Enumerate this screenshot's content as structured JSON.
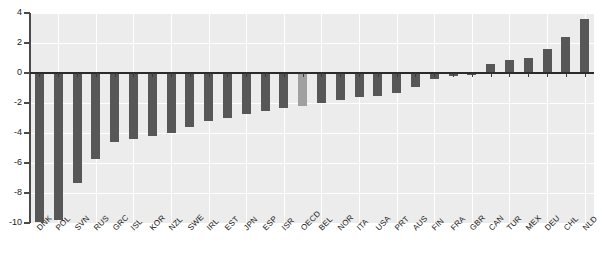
{
  "chart_data": {
    "type": "bar",
    "title": "",
    "subtitle": "",
    "xlabel": "",
    "ylabel": "",
    "ylim": [
      -10,
      4
    ],
    "yticks": [
      4,
      2,
      0,
      -2,
      -4,
      -6,
      -8,
      -10
    ],
    "ytick_labels": [
      "4",
      "2",
      "0",
      "-2",
      "-4",
      "-6",
      "-8",
      "-10"
    ],
    "grid": true,
    "legend": "none",
    "highlight_category": "OECD",
    "bar_color": "#575757",
    "highlight_color": "#a0a0a0",
    "plot_background": "#ececec",
    "gridline_color": "#ffffff",
    "categories": [
      "DNK",
      "POL",
      "SVN",
      "RUS",
      "GRC",
      "ISL",
      "KOR",
      "NZL",
      "SWE",
      "IRL",
      "EST",
      "JPN",
      "ESP",
      "ISR",
      "OECD",
      "BEL",
      "NOR",
      "ITA",
      "USA",
      "PRT",
      "AUS",
      "FIN",
      "FRA",
      "GBR",
      "CAN",
      "TUR",
      "MEX",
      "DEU",
      "CHL",
      "NLD"
    ],
    "values": [
      -9.9,
      -9.8,
      -7.3,
      -5.7,
      -4.6,
      -4.4,
      -4.2,
      -4.0,
      -3.6,
      -3.2,
      -3.0,
      -2.7,
      -2.5,
      -2.3,
      -2.2,
      -2.0,
      -1.8,
      -1.6,
      -1.5,
      -1.3,
      -0.9,
      -0.4,
      -0.2,
      -0.1,
      0.6,
      0.9,
      1.0,
      1.6,
      2.4,
      3.6
    ]
  },
  "axis": {
    "y_top_label": "4",
    "y_bottom_label": "-10"
  }
}
